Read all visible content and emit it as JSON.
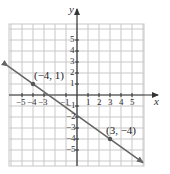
{
  "chart_data": {
    "type": "line",
    "title": "",
    "xlabel": "x",
    "ylabel": "y",
    "xlim": [
      -6,
      6
    ],
    "ylim": [
      -6,
      6
    ],
    "grid": true,
    "x_ticks": [
      -5,
      -4,
      -3,
      -1,
      1,
      2,
      3,
      4,
      5
    ],
    "y_ticks": [
      5,
      4,
      3,
      2,
      1,
      -1,
      -2,
      -3,
      -4,
      -5
    ],
    "x_tick_labels": [
      "−5",
      "−4",
      "−3",
      "−1",
      "1",
      "2",
      "3",
      "4",
      "5"
    ],
    "y_tick_labels": [
      "5",
      "4",
      "3",
      "2",
      "1",
      "−1",
      "−2",
      "−3",
      "−4",
      "−5"
    ],
    "series": [
      {
        "name": "line through (−4, 1) and (3, −4)",
        "equation": "y = -5/7 x - 13/7",
        "slope": -0.714,
        "intercept": -1.857,
        "x_range": [
          -6.3,
          6
        ],
        "arrows": "both"
      }
    ],
    "points": [
      {
        "x": -4,
        "y": 1,
        "label": "(−4, 1)"
      },
      {
        "x": 3,
        "y": -4,
        "label": "(3, −4)"
      }
    ],
    "colors": {
      "line": "#666666",
      "grid": "#c8c8c8",
      "axis": "#333333",
      "point": "#555555"
    }
  },
  "axes": {
    "x_name": "x",
    "y_name": "y"
  },
  "labels": {
    "point1": "(−4, 1)",
    "point2": "(3, −4)"
  },
  "ticks": {
    "x": [
      {
        "v": -5,
        "t": "−5"
      },
      {
        "v": -4,
        "t": "−4"
      },
      {
        "v": -3,
        "t": "−3"
      },
      {
        "v": -1,
        "t": "−1"
      },
      {
        "v": 1,
        "t": "1"
      },
      {
        "v": 2,
        "t": "2"
      },
      {
        "v": 3,
        "t": "3"
      },
      {
        "v": 4,
        "t": "4"
      },
      {
        "v": 5,
        "t": "5"
      }
    ],
    "y": [
      {
        "v": 5,
        "t": "5"
      },
      {
        "v": 4,
        "t": "4"
      },
      {
        "v": 3,
        "t": "3"
      },
      {
        "v": 2,
        "t": "2"
      },
      {
        "v": 1,
        "t": "1"
      },
      {
        "v": -1,
        "t": "−1"
      },
      {
        "v": -2,
        "t": "−2"
      },
      {
        "v": -3,
        "t": "−3"
      },
      {
        "v": -4,
        "t": "−4"
      },
      {
        "v": -5,
        "t": "−5"
      }
    ]
  }
}
